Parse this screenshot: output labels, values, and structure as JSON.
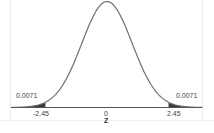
{
  "chart_data": {
    "type": "area",
    "title": "",
    "subtitle": "",
    "xlabel": "Z",
    "ylabel": "",
    "distribution": "standard normal",
    "x_ticks": [
      "-2.45",
      "0",
      "2.45"
    ],
    "x_tick_values": [
      -2.45,
      0,
      2.45
    ],
    "xlim": [
      -3.8,
      3.8
    ],
    "grid": false,
    "legend": null,
    "shaded_regions": [
      {
        "side": "left",
        "from": "-inf",
        "to": -2.45,
        "area": 0.0071,
        "label": "0.0071"
      },
      {
        "side": "right",
        "from": 2.45,
        "to": "inf",
        "area": 0.0071,
        "label": "0.0071"
      }
    ],
    "annotations": [
      "0.0071",
      "0.0071"
    ]
  },
  "labels": {
    "left_area": "0.0071",
    "right_area": "0.0071",
    "tick_left": "-2.45",
    "tick_center": "0",
    "tick_right": "2.45",
    "axis_title": "Z"
  },
  "colors": {
    "curve": "#6e6e6e",
    "shade": "#3a3a3a",
    "axis": "#555555",
    "frame": "#e4e4e4"
  }
}
